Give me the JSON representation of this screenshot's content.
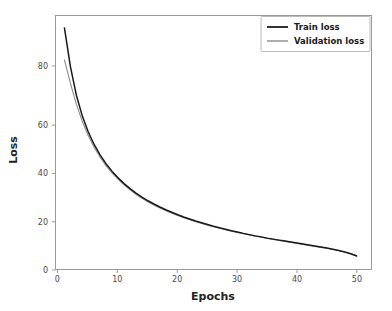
{
  "figure": {
    "title_remnant": "",
    "background_color": "#ffffff",
    "width": 392,
    "height": 311
  },
  "axes": {
    "xlabel": "Epochs",
    "ylabel": "Loss",
    "x_ticks": [
      "0",
      "10",
      "20",
      "30",
      "40",
      "50"
    ],
    "y_ticks": [
      "0",
      "20",
      "40",
      "60",
      "80"
    ],
    "frame_color": "#9a9a9a"
  },
  "legend": {
    "position": "upper right",
    "entries": [
      {
        "label": "Train loss",
        "color": "#1a1a1a"
      },
      {
        "label": "Validation loss",
        "color": "#8c8c8c"
      }
    ]
  },
  "chart_data": {
    "type": "line",
    "title": "",
    "xlabel": "Epochs",
    "ylabel": "Loss",
    "xlim": [
      -1.5,
      51.5
    ],
    "ylim": [
      -3,
      99
    ],
    "grid": false,
    "legend_position": "upper right",
    "x": [
      0,
      1,
      2,
      3,
      4,
      5,
      6,
      7,
      8,
      9,
      10,
      11,
      12,
      13,
      14,
      15,
      16,
      17,
      18,
      19,
      20,
      21,
      22,
      23,
      24,
      25,
      26,
      27,
      28,
      29,
      30,
      31,
      32,
      33,
      34,
      35,
      36,
      37,
      38,
      39,
      40,
      41,
      42,
      43,
      44,
      45,
      46,
      47,
      48,
      49
    ],
    "series": [
      {
        "name": "Train loss",
        "color": "#1a1a1a",
        "values": [
          94.0,
          78.5,
          67.0,
          58.6,
          52.2,
          47.1,
          42.9,
          39.4,
          36.4,
          33.8,
          31.5,
          29.5,
          27.7,
          26.1,
          24.6,
          23.3,
          22.1,
          21.0,
          20.0,
          19.0,
          18.1,
          17.3,
          16.5,
          15.8,
          15.1,
          14.4,
          13.8,
          13.2,
          12.6,
          12.1,
          11.5,
          11.0,
          10.5,
          10.1,
          9.6,
          9.2,
          8.8,
          8.4,
          8.0,
          7.6,
          7.2,
          6.8,
          6.4,
          6.0,
          5.6,
          5.1,
          4.6,
          4.0,
          3.3,
          2.4
        ]
      },
      {
        "name": "Validation loss",
        "color": "#8c8c8c",
        "values": [
          81.2,
          71.8,
          63.4,
          56.4,
          50.7,
          46.0,
          42.0,
          38.6,
          35.7,
          33.2,
          31.0,
          29.0,
          27.2,
          25.6,
          24.2,
          22.9,
          21.7,
          20.6,
          19.6,
          18.7,
          17.8,
          17.0,
          16.2,
          15.5,
          14.8,
          14.2,
          13.6,
          13.0,
          12.4,
          11.9,
          11.4,
          10.9,
          10.4,
          10.0,
          9.5,
          9.1,
          8.7,
          8.3,
          7.9,
          7.5,
          7.1,
          6.7,
          6.3,
          5.9,
          5.5,
          5.1,
          4.6,
          4.0,
          3.4,
          2.6
        ]
      }
    ]
  }
}
